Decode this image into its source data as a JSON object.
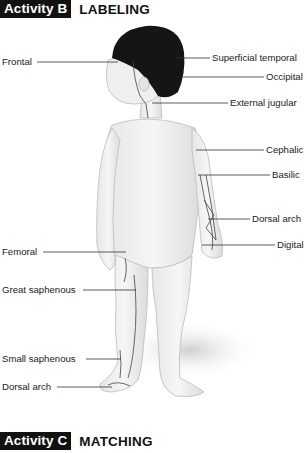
{
  "activity_b": {
    "tag": "Activity B",
    "title": "LABELING"
  },
  "activity_c": {
    "tag": "Activity C",
    "title": "MATCHING"
  },
  "figure": {
    "labels_left": [
      "Frontal",
      "Femoral",
      "Great saphenous",
      "Small saphenous",
      "Dorsal arch"
    ],
    "labels_right": [
      "Superficial temporal",
      "Occipital",
      "External jugular",
      "Cephalic",
      "Basilic",
      "Dorsal arch",
      "Digital"
    ]
  }
}
